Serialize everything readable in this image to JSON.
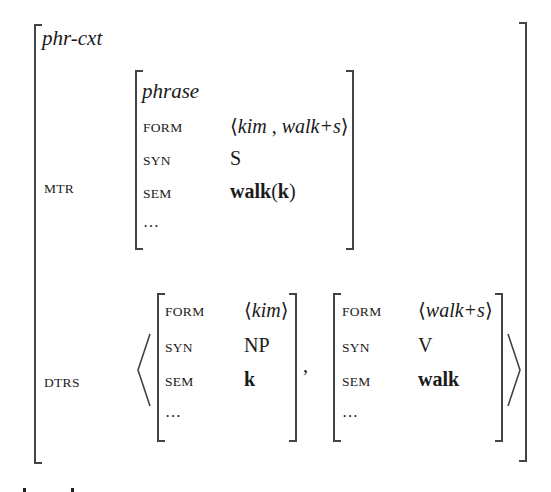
{
  "avm": {
    "type": "phr-cxt",
    "mtr": {
      "label": "MTR",
      "type": "phrase",
      "form": {
        "label": "FORM",
        "lang": "⟨",
        "v1": "kim",
        "sep": " , ",
        "v2": "walk+s",
        "rang": "⟩"
      },
      "syn": {
        "label": "SYN",
        "value": "S"
      },
      "sem": {
        "label": "SEM",
        "pred": "walk",
        "open": "(",
        "arg": "k",
        "close": ")"
      },
      "rest": "…"
    },
    "dtrs": {
      "label": "DTRS",
      "comma": ",",
      "items": [
        {
          "form": {
            "label": "FORM",
            "lang": "⟨",
            "value": "kim",
            "rang": "⟩"
          },
          "syn": {
            "label": "SYN",
            "value": "NP"
          },
          "sem": {
            "label": "SEM",
            "value": "k"
          },
          "rest": "…"
        },
        {
          "form": {
            "label": "FORM",
            "lang": "⟨",
            "value": "walk+s",
            "rang": "⟩"
          },
          "syn": {
            "label": "SYN",
            "value": "V"
          },
          "sem": {
            "label": "SEM",
            "value": "walk"
          },
          "rest": "…"
        }
      ]
    }
  }
}
